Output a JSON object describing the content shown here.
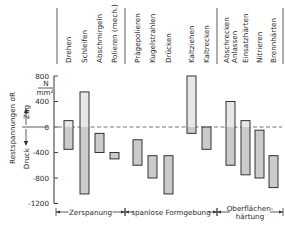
{
  "chart_data": {
    "type": "bar",
    "subtype": "floating-range",
    "title": "",
    "ylabel": "Restspannungen σR",
    "yunit_num": "N",
    "yunit_den": "mm²",
    "y_direction_up": "Zug",
    "y_direction_down": "Druck",
    "ylim": [
      -1200,
      800
    ],
    "yticks": [
      800,
      400,
      0,
      -400,
      -800,
      -1200
    ],
    "ytick_labels": [
      "800",
      "400",
      "0",
      "-400",
      "-800",
      "-1200"
    ],
    "zero_line": "dashed",
    "grid": false,
    "categories": [
      "Drehen",
      "Schleifen",
      "Abschmirgeln",
      "Polieren (mech.)",
      "Prägepolieren",
      "Kugelstrahlen",
      "Drücken",
      "Kaltziehen",
      "Kaltrecken",
      "Abschrecken Anlassen",
      "Einsatzhärten",
      "Nitrieren",
      "Brennhärten"
    ],
    "category_lines": [
      [
        "Drehen"
      ],
      [
        "Schleifen"
      ],
      [
        "Abschmirgeln"
      ],
      [
        "Polieren (mech.)"
      ],
      [
        "Prägepolieren"
      ],
      [
        "Kugelstrahlen"
      ],
      [
        "Drücken"
      ],
      [
        "Kaltziehen"
      ],
      [
        "Kaltrecken"
      ],
      [
        "Abschrecken",
        "Anlassen"
      ],
      [
        "Einsatzhärten"
      ],
      [
        "Nitrieren"
      ],
      [
        "Brennhärten"
      ]
    ],
    "series": [
      {
        "name": "max",
        "values": [
          100,
          550,
          -100,
          -400,
          -200,
          -450,
          -450,
          800,
          0,
          400,
          100,
          -50,
          -450
        ]
      },
      {
        "name": "min",
        "values": [
          -350,
          -1050,
          -400,
          -500,
          -600,
          -800,
          -1050,
          -100,
          -350,
          -600,
          -750,
          -800,
          -950
        ]
      }
    ],
    "groups": [
      {
        "label": "Zerspanung",
        "lines": [
          "Zerspanung"
        ],
        "categories": [
          "Drehen",
          "Schleifen",
          "Abschmirgeln",
          "Polieren (mech.)"
        ]
      },
      {
        "label": "spanlose Formgebung",
        "lines": [
          "spanlose Formgebung"
        ],
        "categories": [
          "Prägepolieren",
          "Kugelstrahlen",
          "Drücken",
          "Kaltziehen",
          "Kaltrecken"
        ]
      },
      {
        "label": "Oberflächenhärtung",
        "lines": [
          "Oberflächen-",
          "härtung"
        ],
        "categories": [
          "Abschrecken Anlassen",
          "Einsatzhärten",
          "Nitrieren",
          "Brennhärten"
        ]
      }
    ],
    "fill_tension": "dotted light",
    "fill_compression": "grey shaded"
  },
  "colors": {
    "bar_stroke": "#333333",
    "bar_fill_compression": "#cfcfcf",
    "bar_fill_tension": "#ececec",
    "axis": "#333333",
    "zero_line": "#666666"
  }
}
